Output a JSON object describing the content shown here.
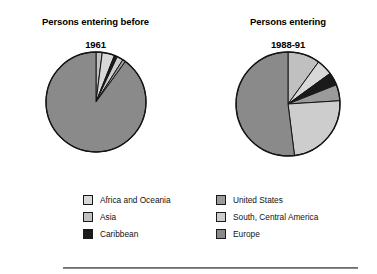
{
  "figure": {
    "background_color": "#ffffff",
    "rule_color": "#8a8a8a"
  },
  "charts": [
    {
      "id": "chart-left",
      "title": "Persons entering before\n1961",
      "title_line1": "Persons entering before",
      "title_line2": "1961",
      "center": [
        89,
        114
      ],
      "radius": 47
    },
    {
      "id": "chart-right",
      "title": "Persons entering\n1988-91",
      "title_line1": "Persons entering",
      "title_line2": "1988-91",
      "center": [
        291,
        113
      ],
      "radius": 49
    }
  ],
  "legend": {
    "position": "bottom",
    "columns": [
      {
        "items": [
          {
            "label": "Africa and Oceania",
            "color": "#d8d8d8",
            "swatch_name": "swatch-africa-oceania"
          },
          {
            "label": "Asia",
            "color": "#c0c0c0",
            "swatch_name": "swatch-asia"
          },
          {
            "label": "Caribbean",
            "color": "#1a1a1a",
            "swatch_name": "swatch-caribbean"
          }
        ]
      },
      {
        "items": [
          {
            "label": "United States",
            "color": "#9b9b9b",
            "swatch_name": "swatch-united-states"
          },
          {
            "label": "South, Central America",
            "color": "#cdcdcd",
            "swatch_name": "swatch-south-central-america"
          },
          {
            "label": "Europe",
            "color": "#8a8a8a",
            "swatch_name": "swatch-europe"
          }
        ]
      }
    ]
  },
  "chart_data": [
    {
      "type": "pie",
      "title": "Persons entering before 1961",
      "categories": [
        "Asia",
        "Africa and Oceania",
        "Caribbean",
        "South, Central America",
        "United States",
        "Europe"
      ],
      "values": [
        2,
        4,
        1,
        2,
        1,
        90
      ],
      "colors": [
        "#c0c0c0",
        "#d8d8d8",
        "#1a1a1a",
        "#cdcdcd",
        "#9b9b9b",
        "#8a8a8a"
      ],
      "start_angle": 0,
      "direction": "clockwise",
      "units": "percent",
      "legend_position": "bottom",
      "grid": false
    },
    {
      "type": "pie",
      "title": "Persons entering 1988-91",
      "categories": [
        "Asia",
        "Africa and Oceania",
        "Caribbean",
        "United States",
        "South, Central America",
        "Europe"
      ],
      "values": [
        10,
        5,
        4,
        5,
        24,
        52
      ],
      "colors": [
        "#c0c0c0",
        "#d8d8d8",
        "#1a1a1a",
        "#9b9b9b",
        "#cdcdcd",
        "#8a8a8a"
      ],
      "start_angle": 0,
      "direction": "clockwise",
      "units": "percent",
      "legend_position": "bottom",
      "grid": false
    }
  ]
}
